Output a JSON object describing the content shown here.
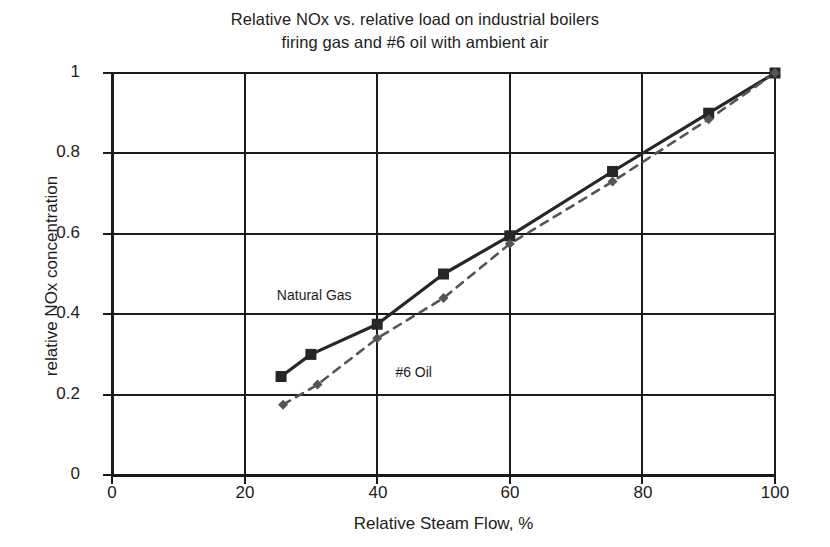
{
  "chart_data": {
    "type": "line",
    "title": "Relative NOx vs. relative load on industrial boilers firing gas and #6 oil with ambient air",
    "title_lines": [
      "Relative NOx vs. relative load on industrial boilers",
      "firing gas and #6 oil with ambient air"
    ],
    "xlabel": "Relative Steam Flow, %",
    "ylabel": "relative NOx concentration",
    "xlim": [
      0,
      100
    ],
    "ylim": [
      0,
      1
    ],
    "xticks": [
      0,
      20,
      40,
      60,
      80,
      100
    ],
    "yticks": [
      0,
      0.2,
      0.4,
      0.6,
      0.8,
      1
    ],
    "xtick_labels": [
      "0",
      "20",
      "40",
      "60",
      "80",
      "100"
    ],
    "ytick_labels": [
      "0",
      "0.2",
      "0.4",
      "0.6",
      "0.8",
      "1"
    ],
    "grid": true,
    "legend_position": "inline-annotations",
    "series": [
      {
        "name": "Natural Gas",
        "style": "solid",
        "marker": "square",
        "color": "#262626",
        "points": [
          {
            "x": 25.5,
            "y": 0.245
          },
          {
            "x": 30.0,
            "y": 0.3
          },
          {
            "x": 40.0,
            "y": 0.375
          },
          {
            "x": 50.0,
            "y": 0.5
          },
          {
            "x": 60.0,
            "y": 0.595
          },
          {
            "x": 75.5,
            "y": 0.755
          },
          {
            "x": 90.0,
            "y": 0.9
          },
          {
            "x": 100.0,
            "y": 1.0
          }
        ]
      },
      {
        "name": "#6 Oil",
        "style": "dashed",
        "marker": "diamond",
        "color": "#555555",
        "points": [
          {
            "x": 25.8,
            "y": 0.175
          },
          {
            "x": 31.0,
            "y": 0.225
          },
          {
            "x": 40.0,
            "y": 0.34
          },
          {
            "x": 50.0,
            "y": 0.44
          },
          {
            "x": 60.0,
            "y": 0.575
          },
          {
            "x": 75.5,
            "y": 0.73
          },
          {
            "x": 90.0,
            "y": 0.885
          },
          {
            "x": 100.0,
            "y": 1.0
          }
        ]
      }
    ],
    "annotations": [
      {
        "text": "Natural Gas",
        "x": 30.5,
        "y": 0.435
      },
      {
        "text": "#6 Oil",
        "x": 45.5,
        "y": 0.245
      }
    ]
  }
}
